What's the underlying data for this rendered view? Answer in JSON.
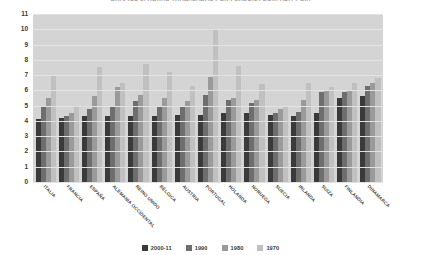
{
  "chart_data": {
    "type": "bar",
    "title": "GRÁFICO 2. HORAS TRABAJADAS POR PERSONA OCUPADA Y DÍA",
    "xlabel": "",
    "ylabel": "",
    "ylim": [
      0,
      11
    ],
    "yticks": [
      0,
      1,
      2,
      3,
      4,
      5,
      6,
      7,
      8,
      9,
      10,
      11
    ],
    "grid": true,
    "legend_position": "bottom",
    "categories": [
      "ITALIA",
      "FRANCIA",
      "ESPAÑA",
      "ALEMANIA OCCIDENTAL",
      "REINO UNIDO",
      "BÉLGICA",
      "AUSTRIA",
      "PORTUGAL",
      "HOLANDA",
      "NORUEGA",
      "SUECIA",
      "IRLANDA",
      "SUIZA",
      "FINLANDIA",
      "DINAMARCA"
    ],
    "series": [
      {
        "name": "2000-11",
        "color": "#3a3a3a",
        "values": [
          4.1,
          4.2,
          4.3,
          4.3,
          4.3,
          4.3,
          4.4,
          4.4,
          4.5,
          4.5,
          4.4,
          4.3,
          4.5,
          5.5,
          5.6
        ]
      },
      {
        "name": "1990",
        "color": "#6e6e6e",
        "values": [
          5.0,
          4.3,
          4.8,
          4.9,
          5.3,
          5.0,
          5.0,
          5.7,
          5.4,
          5.2,
          4.5,
          4.6,
          5.9,
          5.9,
          6.3
        ]
      },
      {
        "name": "1980",
        "color": "#9a9a9a",
        "values": [
          5.5,
          4.5,
          5.6,
          6.2,
          5.7,
          5.5,
          5.3,
          6.9,
          5.5,
          5.4,
          4.8,
          5.4,
          6.0,
          6.0,
          6.5
        ]
      },
      {
        "name": "1970",
        "color": "#c0c0c0",
        "values": [
          7.0,
          5.0,
          7.5,
          6.5,
          7.7,
          7.2,
          6.3,
          10.0,
          7.6,
          6.4,
          5.0,
          6.5,
          6.2,
          6.5,
          6.8
        ]
      }
    ]
  },
  "colors": {
    "plot_background": "#d4d4d4",
    "gridline": "#e2e2e2",
    "axis_text": "#3a3a3a",
    "title_text": "#3f3f3f"
  }
}
